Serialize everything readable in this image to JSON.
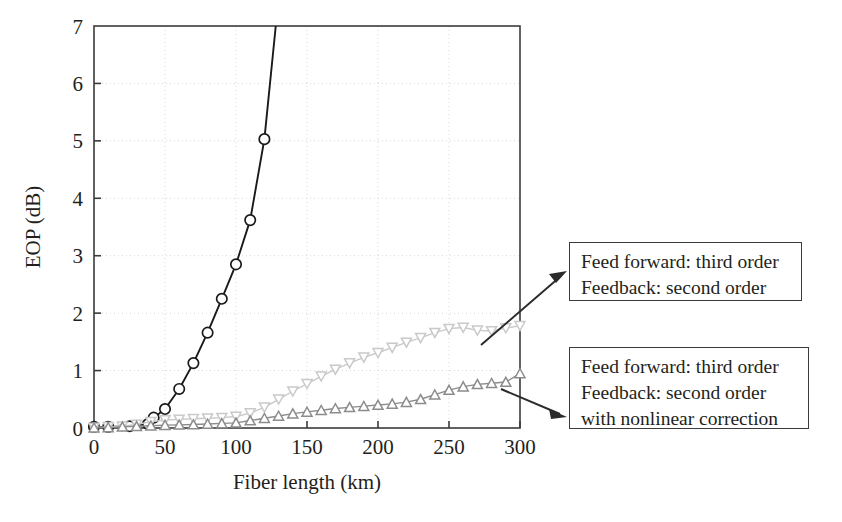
{
  "figure": {
    "name": "eop-vs-fiber-length-chart"
  },
  "chart_data": {
    "type": "line",
    "title": "",
    "xlabel": "Fiber length (km)",
    "ylabel": "EOP (dB)",
    "xlim": [
      0,
      300
    ],
    "ylim": [
      0,
      7
    ],
    "xticks": [
      0,
      50,
      100,
      150,
      200,
      250,
      300
    ],
    "yticks": [
      0,
      1,
      2,
      3,
      4,
      5,
      6,
      7
    ],
    "xtick_labels": [
      "0",
      "50",
      "100",
      "150",
      "200",
      "250",
      "300"
    ],
    "ytick_labels": [
      "0",
      "1",
      "2",
      "3",
      "4",
      "5",
      "6",
      "7"
    ],
    "grid": true,
    "grid_style": "dotted",
    "legend_position": "none",
    "series": [
      {
        "name": "uncompensated",
        "marker": "circle-open",
        "color": "#1a1a1a",
        "x": [
          0,
          10,
          25,
          38,
          42,
          50,
          60,
          70,
          80,
          90,
          100,
          110,
          120,
          128
        ],
        "y": [
          0.02,
          0.02,
          0.03,
          0.07,
          0.18,
          0.33,
          0.68,
          1.13,
          1.66,
          2.25,
          2.85,
          3.62,
          5.03,
          7.0
        ]
      },
      {
        "name": "feed-forward-third-order-feedback-second-order",
        "marker": "triangle-down-open",
        "color": "#c9c9c9",
        "x": [
          0,
          10,
          20,
          30,
          40,
          50,
          60,
          70,
          80,
          90,
          100,
          110,
          120,
          130,
          140,
          150,
          160,
          170,
          180,
          190,
          200,
          210,
          220,
          230,
          240,
          250,
          260,
          270,
          280,
          290,
          300
        ],
        "y": [
          0.01,
          0.02,
          0.03,
          0.06,
          0.11,
          0.14,
          0.15,
          0.16,
          0.17,
          0.18,
          0.2,
          0.26,
          0.36,
          0.5,
          0.64,
          0.77,
          0.9,
          1.02,
          1.13,
          1.23,
          1.31,
          1.4,
          1.49,
          1.57,
          1.66,
          1.73,
          1.75,
          1.7,
          1.69,
          1.74,
          1.78
        ]
      },
      {
        "name": "feed-forward-third-order-feedback-second-order-with-nonlinear-correction",
        "marker": "triangle-up-open",
        "color": "#8c8c8c",
        "x": [
          0,
          10,
          20,
          30,
          40,
          50,
          60,
          70,
          80,
          90,
          100,
          110,
          120,
          130,
          140,
          150,
          160,
          170,
          180,
          190,
          200,
          210,
          220,
          230,
          240,
          250,
          260,
          270,
          280,
          290,
          300
        ],
        "y": [
          0.005,
          0.01,
          0.02,
          0.03,
          0.04,
          0.05,
          0.055,
          0.06,
          0.07,
          0.08,
          0.09,
          0.13,
          0.17,
          0.21,
          0.25,
          0.28,
          0.31,
          0.34,
          0.36,
          0.38,
          0.4,
          0.42,
          0.45,
          0.5,
          0.58,
          0.66,
          0.72,
          0.76,
          0.78,
          0.8,
          0.95
        ]
      }
    ],
    "annotations": [
      {
        "id": "callout-1",
        "lines": [
          "Feed forward: third order",
          "Feedback: second order"
        ],
        "points_to_series": "feed-forward-third-order-feedback-second-order"
      },
      {
        "id": "callout-2",
        "lines": [
          "Feed forward: third order",
          "Feedback: second order",
          "with nonlinear correction"
        ],
        "points_to_series": "feed-forward-third-order-feedback-second-order-with-nonlinear-correction"
      }
    ]
  },
  "colors": {
    "axis": "#3b3b3b",
    "grid": "#d8d8d8",
    "series_black": "#1a1a1a",
    "series_light_gray": "#c9c9c9",
    "series_mid_gray": "#8c8c8c",
    "text": "#231f20"
  }
}
